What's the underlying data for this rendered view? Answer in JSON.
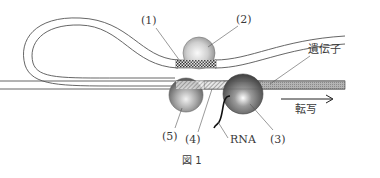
{
  "figure": {
    "caption": "図 1",
    "labels": {
      "l1": "(1)",
      "l2": "(2)",
      "l3": "(3)",
      "l4": "(4)",
      "l5": "(5)",
      "rna": "RNA",
      "gene": "遺伝子",
      "transcription": "転写"
    },
    "colors": {
      "line": "#555555",
      "sphere_light": "#f4f4f4",
      "sphere_mid": "#b8b8b8",
      "sphere_dark": "#5e5e5e",
      "gene_bar": "#a8a8a8",
      "background": "#ffffff"
    }
  }
}
